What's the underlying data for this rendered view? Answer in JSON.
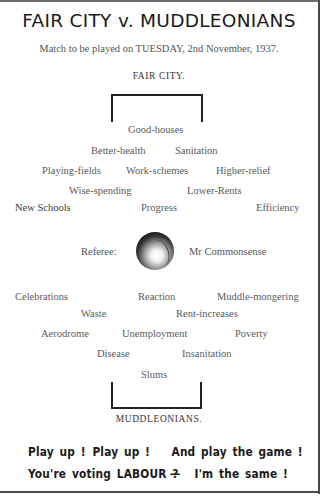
{
  "title": "FAIR CITY v. MUDDLEONIANS",
  "subtitle": "Match to be played on TUESDAY, 2nd November, 1937.",
  "teams": {
    "top": "FAIR CITY.",
    "bottom": "MUDDLEONIANS."
  },
  "fair_city_players": [
    "Good-houses",
    "Better-health",
    "Sanitation",
    "Playing-fields",
    "Work-schemes",
    "Higher-relief",
    "Wise-spending",
    "Lower-Rents",
    "New Schools",
    "Progress",
    "Efficiency"
  ],
  "referee": {
    "label": "Referee:",
    "name": "Mr Commonsense",
    "icon": "football-icon"
  },
  "muddleonians_players": [
    "Celebrations",
    "Reaction",
    "Muddle-mongering",
    "Waste",
    "Rent-increases",
    "Aerodrome",
    "Unemployment",
    "Poverty",
    "Disease",
    "Insanitation",
    "Slums"
  ],
  "slogan": {
    "line1": [
      "Play up !",
      "Play up !",
      "And play the game !"
    ],
    "line2": [
      "You're voting LABOUR ?",
      "—",
      "I'm the same !"
    ]
  }
}
